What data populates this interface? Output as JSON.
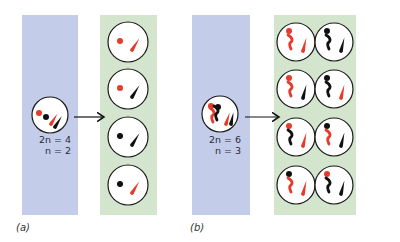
{
  "colors": {
    "blue_strip": "#c3cdea",
    "green_strip": "#d3e5cc",
    "cell_fill": "#ffffff",
    "cell_stroke": "#1a1a1a",
    "red": "#e63a2a",
    "black": "#111111"
  },
  "panel_a": {
    "label": "(a)",
    "parent": {
      "diploid": "2n = 4",
      "haploid": "n = 2"
    },
    "gametes": [
      {
        "dot": "red",
        "rod": "red"
      },
      {
        "dot": "red",
        "rod": "black"
      },
      {
        "dot": "black",
        "rod": "black"
      },
      {
        "dot": "black",
        "rod": "red"
      }
    ]
  },
  "panel_b": {
    "label": "(b)",
    "parent": {
      "diploid": "2n = 6",
      "haploid": "n = 3"
    },
    "gametes": [
      {
        "dot": "red",
        "bent": "red",
        "rod": "red"
      },
      {
        "dot": "black",
        "bent": "black",
        "rod": "black"
      },
      {
        "dot": "red",
        "bent": "red",
        "rod": "black"
      },
      {
        "dot": "black",
        "bent": "black",
        "rod": "red"
      },
      {
        "dot": "red",
        "bent": "black",
        "rod": "red"
      },
      {
        "dot": "black",
        "bent": "red",
        "rod": "black"
      },
      {
        "dot": "black",
        "bent": "red",
        "rod": "red"
      },
      {
        "dot": "red",
        "bent": "black",
        "rod": "black"
      }
    ]
  }
}
